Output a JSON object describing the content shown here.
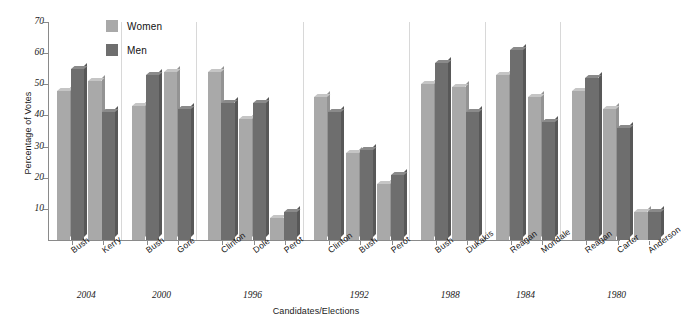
{
  "chart_data": {
    "type": "bar",
    "title": "",
    "xlabel": "Candidates/Elections",
    "ylabel": "Percentage of Votes",
    "ylim": [
      0,
      70
    ],
    "yticks": [
      10,
      20,
      30,
      40,
      50,
      60,
      70
    ],
    "grid": false,
    "legend_position": "top-left",
    "categories": [
      "Bush",
      "Kerry",
      "Bush",
      "Gore",
      "Clinton",
      "Dole",
      "Perot",
      "Clinton",
      "Bush",
      "Perot",
      "Bush",
      "Dukakis",
      "Reagan",
      "Mondale",
      "Reagan",
      "Carter",
      "Anderson"
    ],
    "groups": [
      {
        "year": "2004",
        "candidates": [
          "Bush",
          "Kerry"
        ]
      },
      {
        "year": "2000",
        "candidates": [
          "Bush",
          "Gore"
        ]
      },
      {
        "year": "1996",
        "candidates": [
          "Clinton",
          "Dole",
          "Perot"
        ]
      },
      {
        "year": "1992",
        "candidates": [
          "Clinton",
          "Bush",
          "Perot"
        ]
      },
      {
        "year": "1988",
        "candidates": [
          "Bush",
          "Dukakis"
        ]
      },
      {
        "year": "1984",
        "candidates": [
          "Reagan",
          "Mondale"
        ]
      },
      {
        "year": "1980",
        "candidates": [
          "Reagan",
          "Carter",
          "Anderson"
        ]
      }
    ],
    "series": [
      {
        "name": "Women",
        "color": "#a9a9a9",
        "values": [
          48,
          51,
          43,
          54,
          54,
          39,
          7,
          46,
          28,
          18,
          50,
          49,
          53,
          46,
          48,
          42,
          9
        ]
      },
      {
        "name": "Men",
        "color": "#6e6e6e",
        "values": [
          55,
          41,
          53,
          42,
          44,
          44,
          9,
          41,
          29,
          21,
          57,
          41,
          61,
          38,
          52,
          36,
          9
        ]
      }
    ]
  },
  "legend": {
    "items": [
      {
        "label": "Women",
        "color": "#a9a9a9"
      },
      {
        "label": "Men",
        "color": "#6e6e6e"
      }
    ]
  },
  "axes": {
    "y_title": "Percentage of Votes",
    "x_title": "Candidates/Elections"
  }
}
